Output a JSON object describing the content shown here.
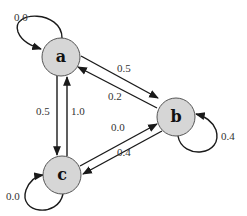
{
  "diagram": {
    "type": "markov-chain",
    "nodes": [
      {
        "id": "a",
        "label": "a",
        "cx": 61,
        "cy": 57
      },
      {
        "id": "b",
        "label": "b",
        "cx": 176,
        "cy": 117
      },
      {
        "id": "c",
        "label": "c",
        "cx": 62,
        "cy": 175
      }
    ],
    "edges": [
      {
        "from": "a",
        "to": "a",
        "label": "0.0"
      },
      {
        "from": "a",
        "to": "b",
        "label": "0.5"
      },
      {
        "from": "b",
        "to": "a",
        "label": "0.2"
      },
      {
        "from": "a",
        "to": "c",
        "label": "0.5"
      },
      {
        "from": "c",
        "to": "a",
        "label": "1.0"
      },
      {
        "from": "c",
        "to": "b",
        "label": "0.0"
      },
      {
        "from": "b",
        "to": "c",
        "label": "0.4"
      },
      {
        "from": "b",
        "to": "b",
        "label": "0.4"
      },
      {
        "from": "c",
        "to": "c",
        "label": "0.0"
      }
    ]
  },
  "colors": {
    "node_fill": "#d6d6d6",
    "node_stroke": "#555555",
    "edge": "#1a1a1a"
  }
}
